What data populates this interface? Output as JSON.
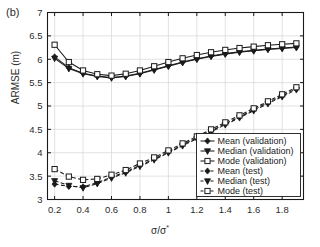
{
  "figure": {
    "panel_label": "(b)",
    "background": "#ffffff",
    "axis_color": "#1a1a1a",
    "grid_color": "#d6d6d6"
  },
  "chart_data": {
    "type": "line",
    "title": "",
    "panel": "(b)",
    "xlabel": "σ/σ*",
    "ylabel": "ARMSE (m)",
    "xlim": [
      0.15,
      1.95
    ],
    "ylim": [
      3,
      7
    ],
    "xticks": [
      0.2,
      0.4,
      0.6,
      0.8,
      1,
      1.2,
      1.4,
      1.6,
      1.8
    ],
    "xticklabels": [
      "0.2",
      "0.4",
      "0.6",
      "0.8",
      "1",
      "1.2",
      "1.4",
      "1.6",
      "1.8"
    ],
    "yticks": [
      3,
      3.5,
      4,
      4.5,
      5,
      5.5,
      6,
      6.5,
      7
    ],
    "yticklabels": [
      "3",
      "3.5",
      "4",
      "4.5",
      "5",
      "5.5",
      "6",
      "6.5",
      "7"
    ],
    "grid": true,
    "legend_position": "lower right",
    "x": [
      0.2,
      0.3,
      0.4,
      0.5,
      0.6,
      0.7,
      0.8,
      0.9,
      1.0,
      1.1,
      1.2,
      1.3,
      1.4,
      1.5,
      1.6,
      1.7,
      1.8,
      1.9
    ],
    "series": [
      {
        "name": "Mean (validation)",
        "marker": "diamond-filled",
        "linestyle": "solid",
        "color": "#1a1a1a",
        "values": [
          6.05,
          5.82,
          5.7,
          5.64,
          5.61,
          5.64,
          5.7,
          5.78,
          5.86,
          5.94,
          6.01,
          6.07,
          6.12,
          6.16,
          6.19,
          6.22,
          6.24,
          6.26
        ]
      },
      {
        "name": "Median (validation)",
        "marker": "triangle-down-filled",
        "linestyle": "solid",
        "color": "#1a1a1a",
        "values": [
          6.02,
          5.8,
          5.69,
          5.63,
          5.6,
          5.63,
          5.69,
          5.77,
          5.85,
          5.93,
          6.0,
          6.06,
          6.11,
          6.15,
          6.18,
          6.21,
          6.23,
          6.25
        ]
      },
      {
        "name": "Mode (validation)",
        "marker": "square-open",
        "linestyle": "solid",
        "color": "#1a1a1a",
        "values": [
          6.31,
          5.94,
          5.76,
          5.68,
          5.65,
          5.69,
          5.76,
          5.85,
          5.94,
          6.02,
          6.09,
          6.15,
          6.2,
          6.24,
          6.27,
          6.3,
          6.32,
          6.34
        ]
      },
      {
        "name": "Mean (test)",
        "marker": "diamond-filled",
        "linestyle": "dashed",
        "color": "#1a1a1a",
        "values": [
          3.33,
          3.28,
          3.27,
          3.36,
          3.48,
          3.59,
          3.73,
          3.87,
          4.02,
          4.17,
          4.32,
          4.47,
          4.62,
          4.77,
          4.92,
          5.07,
          5.22,
          5.37
        ]
      },
      {
        "name": "Median (test)",
        "marker": "triangle-down-filled",
        "linestyle": "dashed",
        "color": "#1a1a1a",
        "values": [
          3.4,
          3.3,
          3.25,
          3.34,
          3.46,
          3.57,
          3.71,
          3.85,
          4.0,
          4.15,
          4.3,
          4.45,
          4.6,
          4.75,
          4.9,
          5.05,
          5.2,
          5.35
        ]
      },
      {
        "name": "Mode (test)",
        "marker": "square-open",
        "linestyle": "dashed",
        "color": "#1a1a1a",
        "values": [
          3.65,
          3.49,
          3.42,
          3.44,
          3.53,
          3.63,
          3.77,
          3.9,
          4.05,
          4.2,
          4.35,
          4.5,
          4.65,
          4.8,
          4.95,
          5.1,
          5.25,
          5.4
        ]
      }
    ],
    "legend": [
      "Mean (validation)",
      "Median (validation)",
      "Mode (validation)",
      "Mean (test)",
      "Median (test)",
      "Mode (test)"
    ]
  }
}
